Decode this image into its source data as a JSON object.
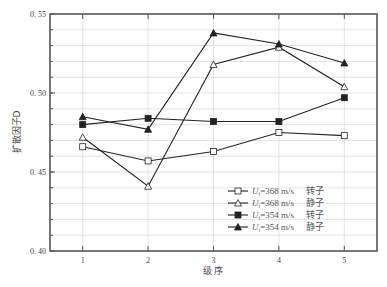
{
  "chart_data": {
    "type": "line",
    "title": "",
    "xlabel": "级 序",
    "ylabel": "扩散因子D",
    "x": [
      1,
      2,
      3,
      4,
      5
    ],
    "xticks": [
      "1",
      "2",
      "3",
      "4",
      "5"
    ],
    "xlim": [
      0.5,
      5.5
    ],
    "ylim": [
      0.4,
      0.55
    ],
    "yticks": [
      "0. 40",
      "0. 45",
      "0. 50",
      "0. 55"
    ],
    "ytick_values": [
      0.4,
      0.45,
      0.5,
      0.55
    ],
    "grid": true,
    "legend_position": "bottom-right",
    "series": [
      {
        "name": "Ut=368 m/s 转子",
        "label_prefix": "U",
        "label_sub": "t",
        "label_speed": "=368 m/s",
        "label_cn": "转子",
        "marker": "open-square",
        "values": [
          0.466,
          0.457,
          0.463,
          0.475,
          0.473
        ]
      },
      {
        "name": "Ut=368 m/s 静子",
        "label_prefix": "U",
        "label_sub": "t",
        "label_speed": "=368 m/s",
        "label_cn": "静子",
        "marker": "open-triangle",
        "values": [
          0.472,
          0.441,
          0.518,
          0.529,
          0.504
        ]
      },
      {
        "name": "Ut=354 m/s 转子",
        "label_prefix": "U",
        "label_sub": "t",
        "label_speed": "=354 m/s",
        "label_cn": "转子",
        "marker": "filled-square",
        "values": [
          0.48,
          0.484,
          0.482,
          0.482,
          0.497
        ]
      },
      {
        "name": "Ut=354 m/s 静子",
        "label_prefix": "U",
        "label_sub": "t",
        "label_speed": "=354 m/s",
        "label_cn": "静子",
        "marker": "filled-triangle",
        "values": [
          0.485,
          0.477,
          0.538,
          0.531,
          0.519
        ]
      }
    ],
    "colors": {
      "line": "#222222",
      "grid": "#d0d0d0",
      "axis": "#555555"
    }
  }
}
